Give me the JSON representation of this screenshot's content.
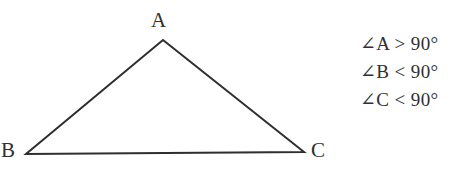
{
  "figure": {
    "type": "obtuse-triangle-diagram",
    "background_color": "#ffffff",
    "stroke_color": "#2f2f2f",
    "stroke_width": 2,
    "vertices": [
      {
        "name": "A",
        "label": "A",
        "x": 163,
        "y": 40,
        "label_x": 151,
        "label_y": 10
      },
      {
        "name": "B",
        "label": "B",
        "x": 26,
        "y": 154,
        "label_x": 1,
        "label_y": 140
      },
      {
        "name": "C",
        "label": "C",
        "x": 304,
        "y": 152,
        "label_x": 311,
        "label_y": 140
      }
    ],
    "edges": [
      {
        "name": "side-AB",
        "from": "B",
        "to": "A"
      },
      {
        "name": "side-AC",
        "from": "A",
        "to": "C"
      },
      {
        "name": "side-BC",
        "from": "B",
        "to": "C"
      }
    ]
  },
  "annotations": {
    "lines": [
      {
        "name": "angle-a-statement",
        "text": "∠A > 90°"
      },
      {
        "name": "angle-b-statement",
        "text": "∠B < 90°"
      },
      {
        "name": "angle-c-statement",
        "text": "∠C < 90°"
      }
    ]
  }
}
